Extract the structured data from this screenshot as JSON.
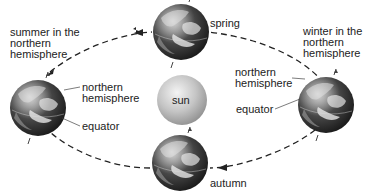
{
  "diagram": {
    "center": {
      "label": "sun",
      "color": "#b8b8b8"
    },
    "orbit": {
      "style": "dashed",
      "direction": "counter-clockwise",
      "color": "#222222"
    },
    "globes": [
      {
        "id": "left",
        "season_label": "summer in the\nnorthern\nhemisphere",
        "callouts": [
          "northern\nhemisphere",
          "equator"
        ]
      },
      {
        "id": "top",
        "season_label": "spring"
      },
      {
        "id": "right",
        "season_label": "winter in the\nnorthern\nhemisphere",
        "callouts": [
          "northern\nhemisphere",
          "equator"
        ]
      },
      {
        "id": "bottom",
        "season_label": "autumn"
      }
    ]
  },
  "labels": {
    "summer": "summer in the\nnorthern\nhemisphere",
    "spring": "spring",
    "winter": "winter in the\nnorthern\nhemisphere",
    "autumn": "autumn",
    "sun": "sun",
    "left_nh": "northern\nhemisphere",
    "left_eq": "equator",
    "right_nh": "northern\nhemisphere",
    "right_eq": "equator"
  }
}
